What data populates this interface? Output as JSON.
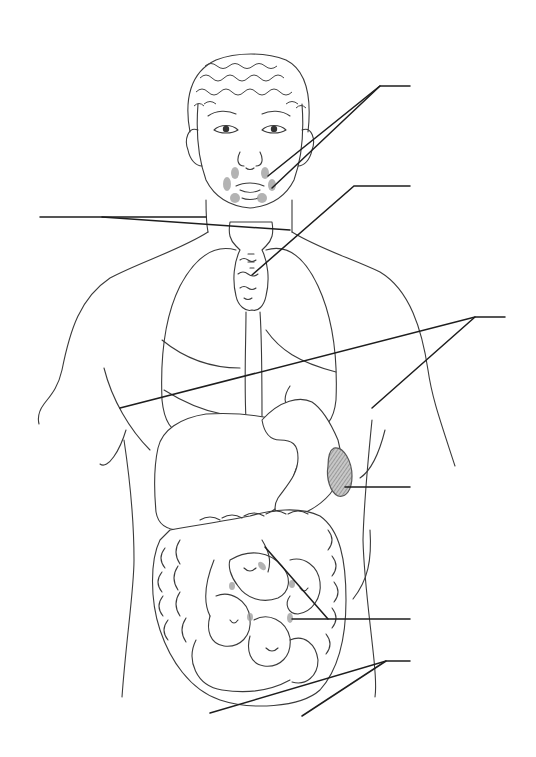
{
  "diagram": {
    "style": "black line art on white, unlabeled leader lines",
    "colors": {
      "background": "#ffffff",
      "line": "#3a3a3a",
      "leader": "#1e1e1e",
      "gland_fill": "#9a9a9a"
    },
    "labels": [
      {
        "id": "salivary-glands",
        "text": "",
        "anchor": [
          410,
          86
        ],
        "targets": [
          [
            268,
            176
          ],
          [
            272,
            188
          ]
        ]
      },
      {
        "id": "thyroid",
        "text": "",
        "anchor": [
          410,
          186
        ],
        "targets": [
          [
            252,
            275
          ]
        ]
      },
      {
        "id": "neck-left",
        "text": "",
        "anchor": [
          40,
          217
        ],
        "targets": [
          [
            206,
            217
          ],
          [
            290,
            230
          ]
        ]
      },
      {
        "id": "diaphragm",
        "text": "",
        "anchor": [
          505,
          317
        ],
        "targets": [
          [
            120,
            408
          ],
          [
            372,
            408
          ]
        ]
      },
      {
        "id": "spleen",
        "text": "",
        "anchor": [
          410,
          487
        ],
        "targets": [
          [
            345,
            487
          ]
        ]
      },
      {
        "id": "small-intestine",
        "text": "",
        "anchor": [
          410,
          619
        ],
        "targets": [
          [
            265,
            547
          ],
          [
            292,
            619
          ]
        ]
      },
      {
        "id": "lower-abdomen",
        "text": "",
        "anchor": [
          410,
          661
        ],
        "targets": [
          [
            210,
            713
          ],
          [
            302,
            716
          ]
        ]
      }
    ]
  }
}
